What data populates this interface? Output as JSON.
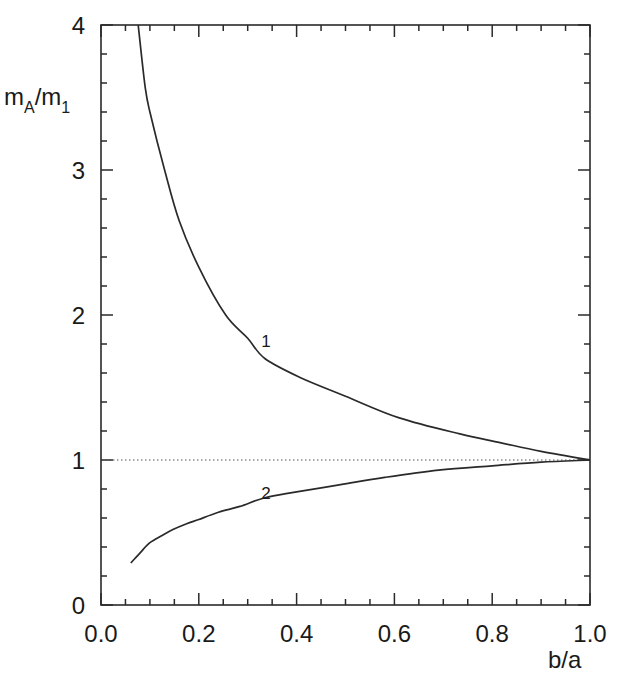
{
  "chart_data": {
    "type": "line",
    "title": "",
    "xlabel": "b/a",
    "ylabel": "m_A/m_1",
    "ylabel_parts": {
      "main": "m",
      "sub1": "A",
      "slash": "/m",
      "sub2": "1"
    },
    "xlim": [
      0.0,
      1.0
    ],
    "ylim": [
      0,
      4
    ],
    "x_ticks": [
      "0.0",
      "0.2",
      "0.4",
      "0.6",
      "0.8",
      "1.0"
    ],
    "x_tick_values": [
      0.0,
      0.2,
      0.4,
      0.6,
      0.8,
      1.0
    ],
    "x_minor_step": 0.05,
    "y_ticks": [
      "0",
      "1",
      "2",
      "3",
      "4"
    ],
    "y_tick_values": [
      0,
      1,
      2,
      3,
      4
    ],
    "y_minor_step": 0.2,
    "grid": false,
    "legend": "none (inline curve labels)",
    "reference_line": {
      "y": 1,
      "style": "dotted"
    },
    "series": [
      {
        "name": "1",
        "label_at": {
          "x": 0.33,
          "y": 1.82
        },
        "x": [
          0.076,
          0.09,
          0.1,
          0.13,
          0.16,
          0.2,
          0.255,
          0.3,
          0.335,
          0.407,
          0.5,
          0.61,
          0.734,
          0.816,
          0.9,
          1.0
        ],
        "y": [
          4.0,
          3.58,
          3.4,
          3.0,
          2.65,
          2.33,
          2.0,
          1.84,
          1.7,
          1.57,
          1.44,
          1.29,
          1.18,
          1.12,
          1.06,
          1.0
        ]
      },
      {
        "name": "2",
        "label_at": {
          "x": 0.33,
          "y": 0.77
        },
        "x": [
          0.061,
          0.08,
          0.1,
          0.125,
          0.147,
          0.175,
          0.2,
          0.24,
          0.284,
          0.335,
          0.4,
          0.49,
          0.58,
          0.69,
          0.8,
          0.9,
          1.0
        ],
        "y": [
          0.29,
          0.36,
          0.43,
          0.48,
          0.52,
          0.56,
          0.59,
          0.64,
          0.68,
          0.74,
          0.78,
          0.83,
          0.88,
          0.93,
          0.96,
          0.985,
          1.0
        ]
      }
    ]
  },
  "layout": {
    "plot": {
      "left": 101,
      "right": 590,
      "top": 25,
      "bottom": 605
    },
    "line_color": "#2a2a2a",
    "ref_line_color": "#555555"
  }
}
